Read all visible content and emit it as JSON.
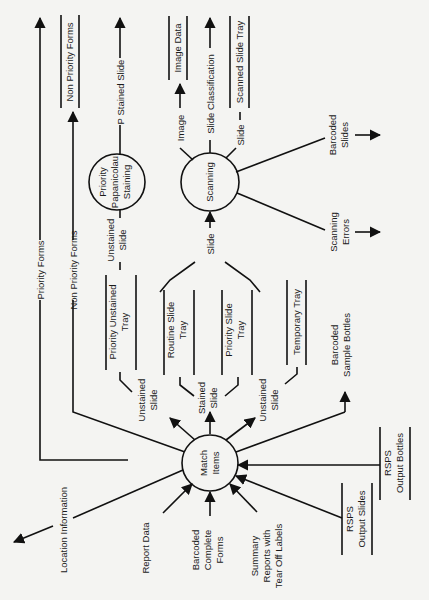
{
  "diagram": {
    "type": "data-flow-diagram",
    "orientation": "rotated-90-ccw",
    "processes": [
      {
        "id": "match",
        "label_lines": [
          "Match",
          "Items"
        ]
      },
      {
        "id": "pap",
        "label_lines": [
          "Priority",
          "Papanicolau",
          "Staining"
        ]
      },
      {
        "id": "scan",
        "label_lines": [
          "Scanning"
        ]
      }
    ],
    "stores": [
      {
        "id": "non_priority_forms_store",
        "label_lines": [
          "Non Priority Forms"
        ]
      },
      {
        "id": "image_data",
        "label_lines": [
          "Image Data"
        ]
      },
      {
        "id": "scanned_slide_tray",
        "label_lines": [
          "Scanned Slide Tray"
        ]
      },
      {
        "id": "priority_unstained_tray",
        "label_lines": [
          "Priority Unstained",
          "Tray"
        ]
      },
      {
        "id": "routine_slide_tray",
        "label_lines": [
          "Routine Slide",
          "Tray"
        ]
      },
      {
        "id": "priority_slide_tray",
        "label_lines": [
          "Priority Slide",
          "Tray"
        ]
      },
      {
        "id": "temporary_tray",
        "label_lines": [
          "Temporary Tray"
        ]
      },
      {
        "id": "rsps_output_slides",
        "label_lines": [
          "RSPS",
          "Output Slides"
        ]
      },
      {
        "id": "rsps_output_bottles",
        "label_lines": [
          "RSPS",
          "Output Bottles"
        ]
      }
    ],
    "flows": {
      "priority_forms": "Priority Forms",
      "non_priority_forms": "Non Priority Forms",
      "p_stained_slide": "P Stained Slide",
      "image": "Image",
      "slide_classification": "Slide Classification",
      "slide_to_tray": "Slide",
      "unstained_slide_pap": [
        "Unstained",
        "Slide"
      ],
      "slide_to_scan": "Slide",
      "barcoded_slides": [
        "Barcoded",
        "Slides"
      ],
      "scanning_errors": [
        "Scanning",
        "Errors"
      ],
      "unstained_slide_1": [
        "Unstained",
        "Slide"
      ],
      "stained_slide": [
        "Stained",
        "Slide"
      ],
      "unstained_slide_2": [
        "Unstained",
        "Slide"
      ],
      "barcoded_sample_bottles": [
        "Barcoded",
        "Sample Bottles"
      ],
      "location_information": "Location Information",
      "report_data": "Report Data",
      "barcoded_complete_forms": [
        "Barcoded",
        "Complete",
        "Forms"
      ],
      "summary_reports": [
        "Summary",
        "Reports with",
        "Tear Off Labels"
      ]
    }
  }
}
